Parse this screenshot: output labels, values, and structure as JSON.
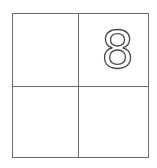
{
  "grid": {
    "rows": 2,
    "cols": 2,
    "cells": [
      {
        "value": ""
      },
      {
        "value": "8"
      },
      {
        "value": ""
      },
      {
        "value": ""
      }
    ]
  },
  "colors": {
    "border": "#6a6a6a",
    "digit_stroke": "#4a4a4a",
    "background": "#ffffff"
  }
}
